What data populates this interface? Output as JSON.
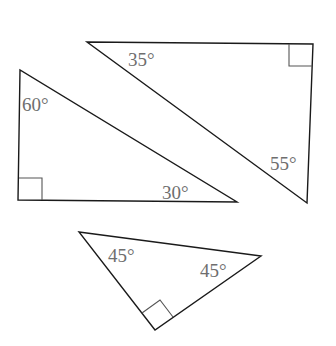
{
  "diagram": {
    "triangles": [
      {
        "id": "top-right",
        "vertices": [
          [
            87,
            42
          ],
          [
            313,
            44
          ],
          [
            307,
            203
          ]
        ],
        "right_angle_vertex": [
          313,
          44
        ],
        "right_angle_square": [
          [
            289,
            44
          ],
          [
            289,
            66
          ],
          [
            312,
            66
          ]
        ],
        "labels": [
          {
            "text": "35°",
            "x": 128,
            "y": 66
          },
          {
            "text": "55°",
            "x": 270,
            "y": 170
          }
        ]
      },
      {
        "id": "left",
        "vertices": [
          [
            20,
            70
          ],
          [
            18,
            200
          ],
          [
            237,
            202
          ]
        ],
        "right_angle_vertex": [
          18,
          200
        ],
        "right_angle_square": [
          [
            19,
            178
          ],
          [
            42,
            178
          ],
          [
            42,
            200
          ]
        ],
        "labels": [
          {
            "text": "60°",
            "x": 22,
            "y": 111
          },
          {
            "text": "30°",
            "x": 162,
            "y": 199
          }
        ]
      },
      {
        "id": "bottom",
        "vertices": [
          [
            79,
            232
          ],
          [
            261,
            256
          ],
          [
            155,
            330
          ]
        ],
        "right_angle_vertex": [
          155,
          330
        ],
        "right_angle_square": [
          [
            142,
            313
          ],
          [
            160,
            300
          ],
          [
            173,
            317
          ]
        ],
        "labels": [
          {
            "text": "45°",
            "x": 108,
            "y": 262
          },
          {
            "text": "45°",
            "x": 200,
            "y": 277
          }
        ]
      }
    ],
    "colors": {
      "edge": "#1a1a1a",
      "label": "#6e6e6e",
      "background": "#ffffff"
    }
  }
}
